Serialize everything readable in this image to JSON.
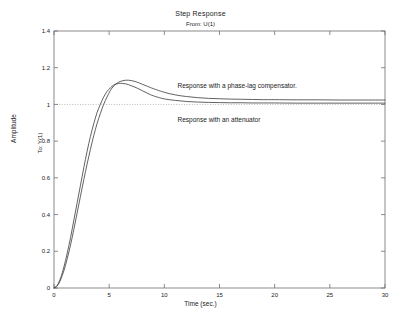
{
  "chart_data": {
    "type": "line",
    "title": "Step Response",
    "subtitle": "From: U(1)",
    "xlabel": "Time (sec.)",
    "ylabel": "Amplitude",
    "ylabel_inner": "To: Y(1)",
    "xlim": [
      0,
      30
    ],
    "ylim": [
      0,
      1.4
    ],
    "xticks": [
      0,
      5,
      10,
      15,
      20,
      25,
      30
    ],
    "xticklabels": [
      "0",
      "5",
      "10",
      "15",
      "20",
      "25",
      "30"
    ],
    "yticks": [
      0,
      0.2,
      0.4,
      0.6,
      0.8,
      1,
      1.2,
      1.4
    ],
    "yticklabels": [
      "0",
      "0.2",
      "0.4",
      "0.6",
      "0.8",
      "1",
      "1.2",
      "1.4"
    ],
    "grid": false,
    "legend_position": "inline-annotations",
    "reference_line": {
      "y": 1,
      "style": "dotted",
      "color": "#999999"
    },
    "annotations": [
      {
        "text": "Response with a phase-lag compensator.",
        "x": 11.2,
        "y": 1.09
      },
      {
        "text": "Response with an attenuator",
        "x": 11.2,
        "y": 0.905
      }
    ],
    "series": [
      {
        "name": "Response with a phase-lag compensator.",
        "color": "#3a3a3a",
        "x": [
          0,
          0.3,
          0.6,
          0.9,
          1.2,
          1.5,
          1.8,
          2.1,
          2.4,
          2.7,
          3.0,
          3.3,
          3.6,
          3.9,
          4.2,
          4.5,
          4.8,
          5.1,
          5.4,
          5.7,
          6.0,
          6.5,
          7.0,
          7.5,
          8.0,
          8.5,
          9.0,
          10.0,
          11.0,
          12.0,
          13.0,
          14.0,
          15.0,
          16.0,
          17.0,
          18.0,
          19.0,
          20.0,
          22.0,
          24.0,
          26.0,
          28.0,
          30.0
        ],
        "y": [
          0,
          0.012,
          0.045,
          0.095,
          0.16,
          0.235,
          0.32,
          0.41,
          0.5,
          0.59,
          0.675,
          0.755,
          0.83,
          0.895,
          0.95,
          1.0,
          1.04,
          1.075,
          1.1,
          1.115,
          1.125,
          1.132,
          1.13,
          1.122,
          1.11,
          1.098,
          1.086,
          1.066,
          1.052,
          1.043,
          1.037,
          1.033,
          1.031,
          1.029,
          1.028,
          1.027,
          1.026,
          1.026,
          1.025,
          1.025,
          1.024,
          1.024,
          1.024
        ]
      },
      {
        "name": "Response with an attenuator",
        "color": "#3a3a3a",
        "x": [
          0,
          0.3,
          0.6,
          0.9,
          1.2,
          1.5,
          1.8,
          2.1,
          2.4,
          2.7,
          3.0,
          3.3,
          3.6,
          3.9,
          4.2,
          4.5,
          4.8,
          5.1,
          5.4,
          5.7,
          6.0,
          6.5,
          7.0,
          7.5,
          8.0,
          8.5,
          9.0,
          10.0,
          11.0,
          12.0,
          13.0,
          14.0,
          15.0,
          16.0,
          17.0,
          18.0,
          19.0,
          20.0,
          22.0,
          24.0,
          26.0,
          28.0,
          30.0
        ],
        "y": [
          0,
          0.015,
          0.055,
          0.115,
          0.19,
          0.275,
          0.37,
          0.465,
          0.56,
          0.655,
          0.745,
          0.825,
          0.895,
          0.955,
          1.0,
          1.04,
          1.07,
          1.09,
          1.105,
          1.112,
          1.115,
          1.112,
          1.102,
          1.09,
          1.075,
          1.06,
          1.047,
          1.03,
          1.022,
          1.016,
          1.013,
          1.011,
          1.01,
          1.009,
          1.009,
          1.008,
          1.008,
          1.008,
          1.007,
          1.007,
          1.007,
          1.007,
          1.007
        ]
      }
    ]
  },
  "axes": {
    "frame_color": "#6e6e6e",
    "background": "#ffffff"
  }
}
